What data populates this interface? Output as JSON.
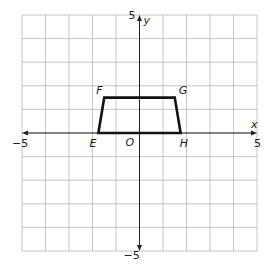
{
  "diagram": {
    "type": "coordinate-plane",
    "x_range": [
      -5,
      5
    ],
    "y_range": [
      -5,
      5
    ],
    "grid_step": 1,
    "axis_labels": {
      "x": "x",
      "y": "y"
    },
    "tick_labels": {
      "x_min": "−5",
      "x_max": "5",
      "y_min": "−5",
      "y_max": "5"
    },
    "origin_label": "O",
    "colors": {
      "grid": "#b8b8b8",
      "axis": "#222222",
      "shape": "#111111"
    },
    "polygon": {
      "name": "trapezoid EFGH",
      "vertices": [
        {
          "label": "E",
          "x": -1.75,
          "y": 0
        },
        {
          "label": "F",
          "x": -1.5,
          "y": 1.5
        },
        {
          "label": "G",
          "x": 1.5,
          "y": 1.5
        },
        {
          "label": "H",
          "x": 1.75,
          "y": 0
        }
      ]
    }
  }
}
